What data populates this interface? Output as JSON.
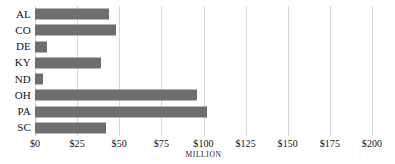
{
  "chart_data": {
    "type": "bar",
    "orientation": "horizontal",
    "title": "",
    "xlabel": "MILLION",
    "ylabel": "",
    "categories": [
      "AL",
      "CO",
      "DE",
      "KY",
      "ND",
      "OH",
      "PA",
      "SC"
    ],
    "values": [
      44,
      48,
      7,
      39,
      5,
      96,
      102,
      42
    ],
    "xlim": [
      0,
      200
    ],
    "ylim": null,
    "xticks": [
      0,
      25,
      50,
      75,
      100,
      125,
      150,
      175,
      200
    ],
    "xticklabels": [
      "$0",
      "$25",
      "$50",
      "$75",
      "$100",
      "$125",
      "$150",
      "$175",
      "$200"
    ],
    "grid": true,
    "grid_axis": "x",
    "legend": false,
    "bar_color": "#6e6e6e",
    "gridline_color": "#d8d8d8",
    "background_color": "#ffffff",
    "unit_label": "MILLION",
    "unit_label_at_tick": "$100"
  },
  "axis": {
    "unit_label": "MILLION"
  }
}
